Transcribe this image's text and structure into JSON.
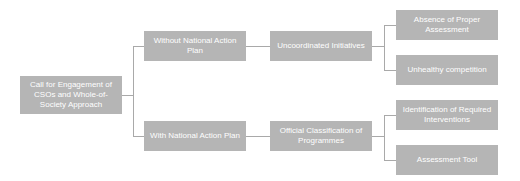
{
  "diagram": {
    "root": {
      "label": "Call for Engagement of CSOs and Whole-of-Society Approach"
    },
    "branches": [
      {
        "label": "Without National Action Plan",
        "child": {
          "label": "Uncoordinated Initiatives",
          "leaves": [
            {
              "label": "Absence of Proper Assessment"
            },
            {
              "label": "Unhealthy competition"
            }
          ]
        }
      },
      {
        "label": "With National Action Plan",
        "child": {
          "label": "Official Classification of Programmes",
          "leaves": [
            {
              "label": "Identification of Required Interventions"
            },
            {
              "label": "Assessment Tool"
            }
          ]
        }
      }
    ],
    "colors": {
      "node_fill": "#b5b5b5",
      "node_text": "#ffffff",
      "connector": "#a9a9a9"
    }
  }
}
